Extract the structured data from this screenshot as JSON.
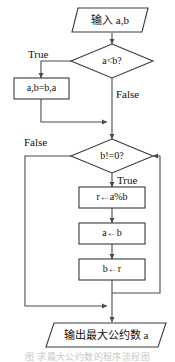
{
  "diagram": {
    "type": "flowchart",
    "colors": {
      "stroke": "#3a3a3a",
      "connector": "#4a4a4a",
      "fill": "#ffffff",
      "text": "#111111",
      "caption": "#c9c9c9"
    },
    "nodes": [
      {
        "id": "input",
        "shape": "parallelogram",
        "label": "输入 a,b"
      },
      {
        "id": "cond1",
        "shape": "diamond",
        "label": "a<b?"
      },
      {
        "id": "swap",
        "shape": "rectangle",
        "label": "a,b=b,a"
      },
      {
        "id": "cond2",
        "shape": "diamond",
        "label": "b!=0?"
      },
      {
        "id": "mod",
        "shape": "rectangle",
        "label": "r←a%b"
      },
      {
        "id": "assigna",
        "shape": "rectangle",
        "label": "a←b"
      },
      {
        "id": "assignb",
        "shape": "rectangle",
        "label": "b←r"
      },
      {
        "id": "output",
        "shape": "parallelogram",
        "label": "输出最大公约数 a"
      }
    ],
    "branch_labels": {
      "cond1_true": "True",
      "cond1_false": "False",
      "cond2_false": "False",
      "cond2_true": "True"
    },
    "caption": "图 求最大公约数的程序流程图"
  }
}
